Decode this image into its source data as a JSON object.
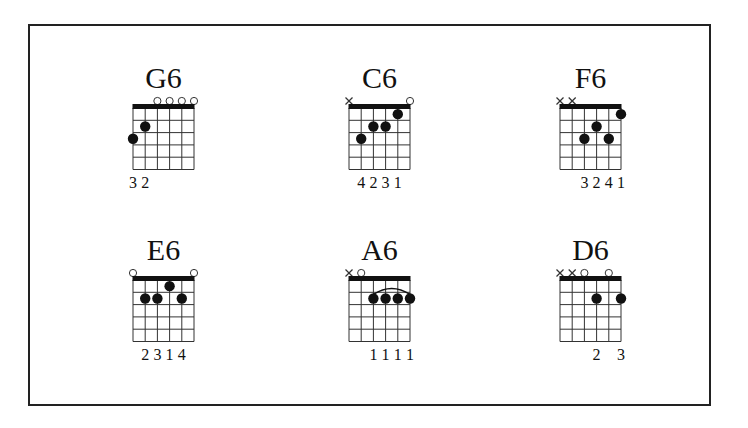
{
  "sheet": {
    "title": "Sixth chords",
    "frets_shown": 5,
    "strings": 6,
    "colors": {
      "ink": "#111111",
      "frame": "#222222",
      "background": "#ffffff"
    }
  },
  "chords": [
    {
      "name": "G6",
      "grid": {
        "left": 133,
        "nut_top": 108
      },
      "markers": [
        "",
        "",
        "o",
        "o",
        "o",
        "o"
      ],
      "dots": [
        {
          "string": 1,
          "fret": 3
        },
        {
          "string": 2,
          "fret": 2
        }
      ],
      "barre": null,
      "fingering": [
        "3",
        "2",
        "",
        "",
        "",
        ""
      ]
    },
    {
      "name": "C6",
      "grid": {
        "left": 349,
        "nut_top": 108
      },
      "markers": [
        "x",
        "",
        "",
        "",
        "",
        "o"
      ],
      "dots": [
        {
          "string": 2,
          "fret": 3
        },
        {
          "string": 3,
          "fret": 2
        },
        {
          "string": 4,
          "fret": 2
        },
        {
          "string": 5,
          "fret": 1
        }
      ],
      "barre": null,
      "fingering": [
        "",
        "4",
        "2",
        "3",
        "1",
        ""
      ]
    },
    {
      "name": "F6",
      "grid": {
        "left": 560,
        "nut_top": 108
      },
      "markers": [
        "x",
        "x",
        "",
        "",
        "",
        ""
      ],
      "dots": [
        {
          "string": 3,
          "fret": 3
        },
        {
          "string": 4,
          "fret": 2
        },
        {
          "string": 5,
          "fret": 3
        },
        {
          "string": 6,
          "fret": 1
        }
      ],
      "barre": null,
      "fingering": [
        "",
        "",
        "3",
        "2",
        "4",
        "1"
      ]
    },
    {
      "name": "E6",
      "grid": {
        "left": 133,
        "nut_top": 280
      },
      "markers": [
        "o",
        "",
        "",
        "",
        "",
        "o"
      ],
      "dots": [
        {
          "string": 2,
          "fret": 2
        },
        {
          "string": 3,
          "fret": 2
        },
        {
          "string": 4,
          "fret": 1
        },
        {
          "string": 5,
          "fret": 2
        }
      ],
      "barre": null,
      "fingering": [
        "",
        "2",
        "3",
        "1",
        "4",
        ""
      ]
    },
    {
      "name": "A6",
      "grid": {
        "left": 349,
        "nut_top": 280
      },
      "markers": [
        "x",
        "o",
        "",
        "",
        "",
        ""
      ],
      "dots": [
        {
          "string": 3,
          "fret": 2
        },
        {
          "string": 4,
          "fret": 2
        },
        {
          "string": 5,
          "fret": 2
        },
        {
          "string": 6,
          "fret": 2
        }
      ],
      "barre": {
        "from_string": 3,
        "to_string": 6,
        "fret": 2
      },
      "fingering": [
        "",
        "",
        "1",
        "1",
        "1",
        "1"
      ]
    },
    {
      "name": "D6",
      "grid": {
        "left": 560,
        "nut_top": 280
      },
      "markers": [
        "x",
        "x",
        "o",
        "",
        "o",
        ""
      ],
      "dots": [
        {
          "string": 4,
          "fret": 2
        },
        {
          "string": 6,
          "fret": 2
        }
      ],
      "barre": null,
      "fingering": [
        "",
        "",
        "",
        "2",
        "",
        "3"
      ]
    }
  ]
}
